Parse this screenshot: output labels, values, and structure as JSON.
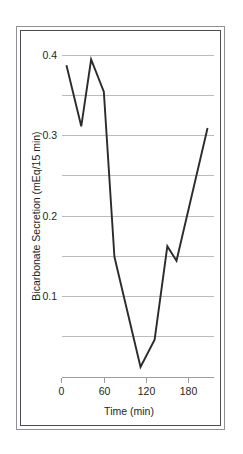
{
  "chart_data": {
    "type": "line",
    "title": "",
    "xlabel": "Time (min)",
    "ylabel": "Bicarbonate Secretion (mEq/15 min)",
    "xlim": [
      0,
      210
    ],
    "ylim": [
      0,
      0.41
    ],
    "xticks": [
      0,
      60,
      120,
      180
    ],
    "xticklabels": [
      "0",
      "60",
      "120",
      "180"
    ],
    "yticks": [
      0.1,
      0.2,
      0.3,
      0.4
    ],
    "yticklabels": [
      "0.1",
      "0.2",
      "0.3",
      "0.4"
    ],
    "gridlines_y": [
      0.05,
      0.1,
      0.15,
      0.2,
      0.25,
      0.3,
      0.35,
      0.4
    ],
    "grid": "horizontal",
    "legend": "none",
    "line_color": "#2b2b2d",
    "grid_color": "#b9bbbd",
    "axis_color": "#9a9c9f",
    "series": [
      {
        "name": "Bicarbonate Secretion",
        "x": [
          7,
          28,
          42,
          60,
          75,
          112,
          132,
          150,
          163,
          207
        ],
        "y": [
          0.388,
          0.312,
          0.395,
          0.355,
          0.15,
          0.013,
          0.047,
          0.163,
          0.145,
          0.31
        ]
      }
    ]
  },
  "axes": {
    "x_title": "Time (min)",
    "y_title": "Bicarbonate Secretion (mEq/15 min)",
    "x_tick_labels": [
      "0",
      "60",
      "120",
      "180"
    ],
    "y_tick_labels": [
      "0.1",
      "0.2",
      "0.3",
      "0.4"
    ]
  }
}
